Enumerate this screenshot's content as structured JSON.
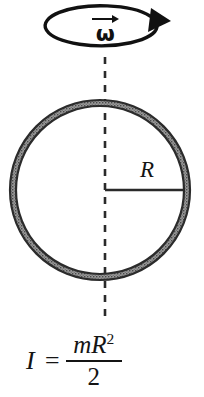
{
  "figure": {
    "background_color": "#ffffff"
  },
  "rotation_indicator": {
    "name": "angular-velocity-arrow",
    "symbol": "ω",
    "vector_arrow": "right-arrow-overbar",
    "direction": "counterclockwise",
    "stroke_color": "#111111",
    "ellipse": {
      "cx": 104,
      "cy": 32,
      "rx": 56,
      "ry": 20
    },
    "arrowhead": {
      "x": 150,
      "y": 14,
      "fill": "#111111",
      "points": "149,31 152,9 170,20"
    }
  },
  "axis": {
    "name": "rotation-axis",
    "style": "dashed",
    "x": 105,
    "y_top": 57,
    "y_bottom": 318,
    "color": "#2a2a2a",
    "dash_pattern": "7 7",
    "width": 2.6
  },
  "hoop": {
    "name": "hoop-ring",
    "center_x": 100,
    "center_y": 190,
    "outer_radius": 90,
    "inner_radius": 84,
    "band_thickness": 6,
    "outline_color": "#2b2b2b",
    "fill_color": "#8a8a8a",
    "fill_texture": "stippled"
  },
  "radius": {
    "name": "radius-line",
    "label": "R",
    "x_start": 105,
    "x_end": 184,
    "y": 190,
    "color": "#2a2a2a",
    "width": 2.4
  },
  "formula": {
    "name": "moment-of-inertia-formula",
    "lhs": "I =",
    "numerator_base": "mR",
    "numerator_exponent": "2",
    "denominator": "2",
    "full_text": "I = mR² / 2"
  }
}
